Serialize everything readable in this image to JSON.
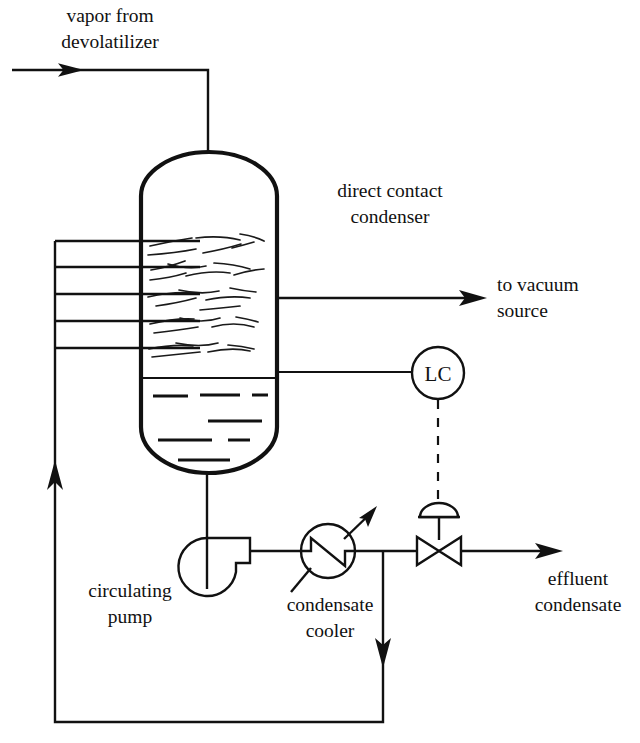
{
  "diagram": {
    "type": "process-flow-diagram",
    "background_color": "#ffffff",
    "line_color": "#111111"
  },
  "labels": {
    "inlet_line1": "vapor from",
    "inlet_line2": "devolatilizer",
    "vessel_line1": "direct contact",
    "vessel_line2": "condenser",
    "vacuum_line1": "to vacuum",
    "vacuum_line2": "source",
    "pump_line1": "circulating",
    "pump_line2": "pump",
    "cooler_line1": "condensate",
    "cooler_line2": "cooler",
    "effluent_line1": "effluent",
    "effluent_line2": "condensate",
    "controller_tag": "LC"
  },
  "equipment": [
    {
      "name": "direct-contact-condenser",
      "symbol": "vertical-vessel-with-spray-nozzles",
      "label": "direct contact condenser"
    },
    {
      "name": "circulating-pump",
      "symbol": "centrifugal-pump",
      "label": "circulating pump"
    },
    {
      "name": "condensate-cooler",
      "symbol": "heat-exchanger-circle",
      "label": "condensate cooler"
    },
    {
      "name": "level-controller",
      "symbol": "instrument-bubble",
      "label": "LC"
    },
    {
      "name": "level-control-valve",
      "symbol": "globe-control-valve-diaphragm",
      "label": ""
    }
  ],
  "streams": [
    {
      "name": "vapor-from-devolatilizer",
      "label": "vapor from devolatilizer",
      "direction": "in"
    },
    {
      "name": "to-vacuum-source",
      "label": "to vacuum source",
      "direction": "out"
    },
    {
      "name": "effluent-condensate",
      "label": "effluent condensate",
      "direction": "out"
    },
    {
      "name": "recirculation-loop",
      "label": "",
      "direction": "recycle"
    }
  ],
  "spray_nozzle_count": 5
}
